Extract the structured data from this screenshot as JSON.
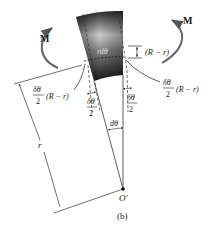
{
  "figure": {
    "caption": "(b)",
    "moment_left": "M",
    "moment_right": "M",
    "arc_length_label": "rdθ",
    "offset_label": "(R − r)",
    "left_displacement": {
      "num": "δθ",
      "den": "2",
      "suffix": "(R − r)"
    },
    "right_displacement": {
      "num": "δθ",
      "den": "2",
      "suffix": "(R − r)"
    },
    "left_half_angle": {
      "num": "δθ",
      "den": "2"
    },
    "right_half_angle": {
      "num": "δθ",
      "den": "2"
    },
    "center_angle": "dθ",
    "radius_label": "r",
    "center_label": "O′"
  },
  "colors": {
    "block_dark": "#1e1e1e",
    "block_light": "#d8d8d8",
    "line": "#333333",
    "arrow": "#555555"
  }
}
